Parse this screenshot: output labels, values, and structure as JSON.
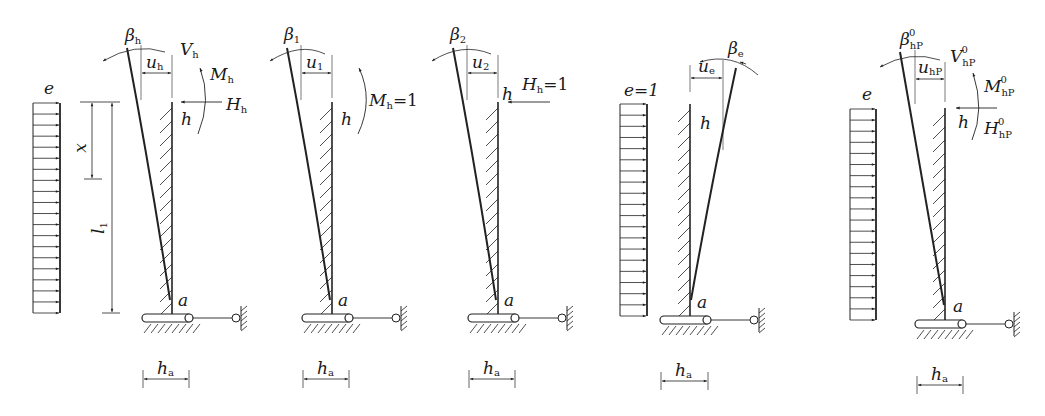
{
  "colors": {
    "ink": "#222222",
    "background": "#ffffff"
  },
  "panels": [
    {
      "id": "panel-1",
      "load_label": "e",
      "beta": {
        "main": "β",
        "sub": "h",
        "sup": ""
      },
      "u": {
        "main": "u",
        "sub": "h"
      },
      "V": {
        "main": "V",
        "sub": "h",
        "sup": ""
      },
      "M": {
        "main": "M",
        "sub": "h",
        "sup": "",
        "suffix": ""
      },
      "H": {
        "main": "H",
        "sub": "h",
        "sup": "",
        "suffix": ""
      },
      "x_label": "x",
      "l_label": {
        "main": "l",
        "sub": "1"
      },
      "h_label": "h",
      "a_label": "a",
      "ha_label": {
        "main": "h",
        "sub": "a"
      }
    },
    {
      "id": "panel-2",
      "beta": {
        "main": "β",
        "sub": "1"
      },
      "u": {
        "main": "u",
        "sub": "1"
      },
      "M": {
        "main": "M",
        "sub": "h",
        "suffix": "=1"
      },
      "h_label": "h",
      "a_label": "a",
      "ha_label": {
        "main": "h",
        "sub": "a"
      }
    },
    {
      "id": "panel-3",
      "beta": {
        "main": "β",
        "sub": "2"
      },
      "u": {
        "main": "u",
        "sub": "2"
      },
      "H": {
        "main": "H",
        "sub": "h",
        "suffix": "=1"
      },
      "h_label": "h",
      "a_label": "a",
      "ha_label": {
        "main": "h",
        "sub": "a"
      }
    },
    {
      "id": "panel-4",
      "load_label": "e=1",
      "beta": {
        "main": "β",
        "sub": "e"
      },
      "u": {
        "main": "u",
        "sub": "e"
      },
      "h_label": "h",
      "a_label": "a",
      "ha_label": {
        "main": "h",
        "sub": "a"
      }
    },
    {
      "id": "panel-5",
      "load_label": "e",
      "beta": {
        "main": "β",
        "sub": "hP",
        "sup": "0"
      },
      "u": {
        "main": "u",
        "sub": "hP"
      },
      "V": {
        "main": "V",
        "sub": "hP",
        "sup": "0"
      },
      "M": {
        "main": "M",
        "sub": "hP",
        "sup": "0"
      },
      "H": {
        "main": "H",
        "sub": "hP",
        "sup": "0"
      },
      "h_label": "h",
      "a_label": "a",
      "ha_label": {
        "main": "h",
        "sub": "a"
      }
    }
  ]
}
